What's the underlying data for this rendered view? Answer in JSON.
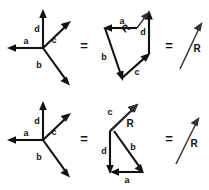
{
  "figure": {
    "width": 209,
    "height": 190,
    "background": "#ffffff",
    "stroke_color": "#111111",
    "thin_stroke_color": "#333333"
  },
  "labels": {
    "a": "a",
    "b": "b",
    "c": "c",
    "d": "d",
    "R": "R",
    "equals": "="
  },
  "rows": [
    {
      "id": "row-top",
      "name": "top-row",
      "star": {
        "name": "concurrent-vector-star-top",
        "origin": [
          43,
          48
        ],
        "vectors": [
          {
            "label": "a",
            "from": [
              43,
              48
            ],
            "to": [
              9,
              48
            ],
            "label_pos": [
              26,
              42
            ]
          },
          {
            "label": "d",
            "from": [
              43,
              48
            ],
            "to": [
              43,
              11
            ],
            "label_pos": [
              37,
              30
            ]
          },
          {
            "label": "c",
            "from": [
              43,
              48
            ],
            "to": [
              69,
              23
            ],
            "label_pos": [
              53,
              41
            ]
          },
          {
            "label": "b",
            "from": [
              43,
              48
            ],
            "to": [
              69,
              84
            ],
            "label_pos": [
              39,
              66
            ]
          }
        ]
      },
      "equals_1": {
        "name": "equals-sign-top-left",
        "pos": [
          84,
          47
        ]
      },
      "polygon": {
        "name": "head-to-tail-polygon-top",
        "order": [
          "a",
          "b",
          "c",
          "d"
        ],
        "vertices": [
          [
            137,
            28
          ],
          [
            105,
            28
          ],
          [
            122,
            78
          ],
          [
            149,
            54
          ],
          [
            149,
            12
          ]
        ],
        "segments": [
          {
            "label": "a",
            "from": [
              137,
              28
            ],
            "to": [
              105,
              28
            ],
            "label_pos": [
              122,
              22
            ]
          },
          {
            "label": "b",
            "from": [
              105,
              28
            ],
            "to": [
              122,
              78
            ],
            "label_pos": [
              104,
              58
            ]
          },
          {
            "label": "c",
            "from": [
              122,
              78
            ],
            "to": [
              149,
              54
            ],
            "label_pos": [
              137,
              73
            ]
          },
          {
            "label": "d",
            "from": [
              149,
              54
            ],
            "to": [
              149,
              12
            ],
            "label_pos": [
              143,
              33
            ]
          }
        ],
        "resultant": {
          "label": "R",
          "from": [
            137,
            28
          ],
          "to": [
            148,
            13
          ],
          "label_pos": [
            126,
            29
          ]
        }
      },
      "equals_2": {
        "name": "equals-sign-top-right",
        "pos": [
          169,
          47
        ]
      },
      "resultant_alone": {
        "name": "resultant-arrow-top",
        "label": "R",
        "from": [
          180,
          69
        ],
        "to": [
          202,
          23
        ],
        "label_pos": [
          197,
          48
        ]
      }
    },
    {
      "id": "row-bottom",
      "name": "bottom-row",
      "star": {
        "name": "concurrent-vector-star-bottom",
        "origin": [
          43,
          140
        ],
        "vectors": [
          {
            "label": "a",
            "from": [
              43,
              140
            ],
            "to": [
              9,
              140
            ],
            "label_pos": [
              26,
              134
            ]
          },
          {
            "label": "d",
            "from": [
              43,
              140
            ],
            "to": [
              43,
              103
            ],
            "label_pos": [
              37,
              122
            ]
          },
          {
            "label": "c",
            "from": [
              43,
              140
            ],
            "to": [
              69,
              115
            ],
            "label_pos": [
              53,
              133
            ]
          },
          {
            "label": "b",
            "from": [
              43,
              140
            ],
            "to": [
              69,
              176
            ],
            "label_pos": [
              39,
              158
            ]
          }
        ]
      },
      "equals_1": {
        "name": "equals-sign-bottom-left",
        "pos": [
          84,
          140
        ]
      },
      "polygon": {
        "name": "head-to-tail-polygon-bottom",
        "order": [
          "d",
          "a",
          "b",
          "c"
        ],
        "vertices": [
          [
            110,
            131
          ],
          [
            110,
            172
          ],
          [
            143,
            172
          ],
          [
            114,
            131
          ],
          [
            136,
            105
          ]
        ],
        "segments": [
          {
            "label": "d",
            "from": [
              110,
              131
            ],
            "to": [
              110,
              172
            ],
            "label_pos": [
              104,
              152
            ]
          },
          {
            "label": "a",
            "from": [
              143,
              172
            ],
            "to": [
              110,
              172
            ],
            "label_pos": [
              127,
              180
            ]
          },
          {
            "label": "b",
            "from": [
              114,
              131
            ],
            "to": [
              143,
              172
            ],
            "label_pos": [
              133,
              148
            ]
          },
          {
            "label": "c",
            "from": [
              110,
              131
            ],
            "to": [
              136,
              105
            ],
            "label_pos": [
              110,
              113
            ]
          }
        ],
        "resultant": {
          "label": "R",
          "from": [
            111,
            131
          ],
          "to": [
            137,
            104
          ],
          "label_pos": [
            129,
            124
          ]
        }
      },
      "equals_2": {
        "name": "equals-sign-bottom-right",
        "pos": [
          169,
          140
        ]
      },
      "resultant_alone": {
        "name": "resultant-arrow-bottom",
        "label": "R",
        "from": [
          176,
          164
        ],
        "to": [
          199,
          118
        ],
        "label_pos": [
          194,
          143
        ]
      }
    }
  ]
}
